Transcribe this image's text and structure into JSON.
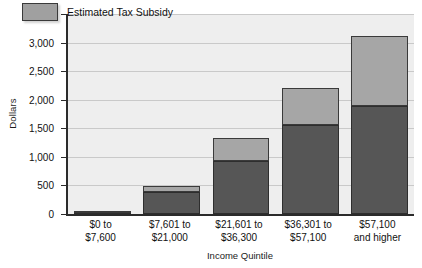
{
  "chart_data": {
    "type": "bar",
    "title": "",
    "subtitle": "",
    "stacked": true,
    "xlabel": "Income Quintile",
    "ylabel": "Dollars",
    "ylim": [
      0,
      3500
    ],
    "ytick_values": [
      0,
      500,
      1000,
      1500,
      2000,
      2500,
      3000,
      3500
    ],
    "ytick_labels": [
      "0",
      "500",
      "1,000",
      "1,500",
      "2,000",
      "2,500",
      "3,000",
      "3,500"
    ],
    "grid": true,
    "legend_position": "top-left",
    "categories": [
      "$0 to\n$7,600",
      "$7,601 to\n$21,000",
      "$21,601 to\n$36,300",
      "$36,301 to\n$57,100",
      "$57,100\nand higher"
    ],
    "category_lines": [
      [
        "$0 to",
        "$7,600"
      ],
      [
        "$7,601 to",
        "$21,000"
      ],
      [
        "$21,601 to",
        "$36,300"
      ],
      [
        "$36,301 to",
        "$57,100"
      ],
      [
        "$57,100",
        "and higher"
      ]
    ],
    "series": [
      {
        "name": "Base",
        "color": "#565656",
        "values": [
          20,
          390,
          930,
          1560,
          1890
        ]
      },
      {
        "name": "Estimated Tax Subsidy",
        "color": "#a6a6a6",
        "values": [
          10,
          100,
          400,
          640,
          1220
        ]
      }
    ],
    "totals": [
      30,
      490,
      1330,
      2200,
      3110
    ]
  },
  "legend": {
    "entries": [
      {
        "label": "Estimated Tax Subsidy",
        "color": "#a0a0a0"
      }
    ]
  },
  "axes": {
    "y_title": "Dollars",
    "x_title": "Income Quintile"
  },
  "colors": {
    "plot_background": "#eeeeee",
    "gridline": "#c9c9c9",
    "axis": "#2b2b2b",
    "bar_base": "#565656",
    "bar_subsidy": "#a6a6a6",
    "text": "#111111"
  }
}
